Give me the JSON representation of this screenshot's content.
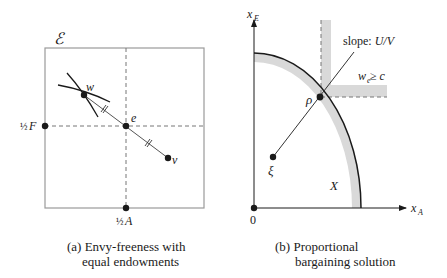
{
  "panel_a": {
    "corner_label": "ℰ",
    "points": {
      "w": "w",
      "e": "e",
      "v": "v",
      "half_F": "F",
      "half_A": "A",
      "half": "½"
    },
    "caption_line1": "(a) Envy-freeness with",
    "caption_line2": "equal endowments"
  },
  "panel_b": {
    "y_axis_label": "x",
    "y_axis_sub": "E",
    "x_axis_label": "x",
    "x_axis_sub": "A",
    "origin_label": "0",
    "slope_prefix": "slope: ",
    "slope_value": "U/V",
    "constraint_w": "w",
    "constraint_sub": "e",
    "constraint_rest": " ≥ c",
    "rho": "ρ",
    "xi": "ξ",
    "set_label": "X",
    "caption_line1": "(b) Proportional",
    "caption_line2": "bargaining solution"
  },
  "colors": {
    "line": "#1a1a1a",
    "dashed": "#777777",
    "band": "#d9d9d9",
    "box": "#9a9a9a"
  }
}
